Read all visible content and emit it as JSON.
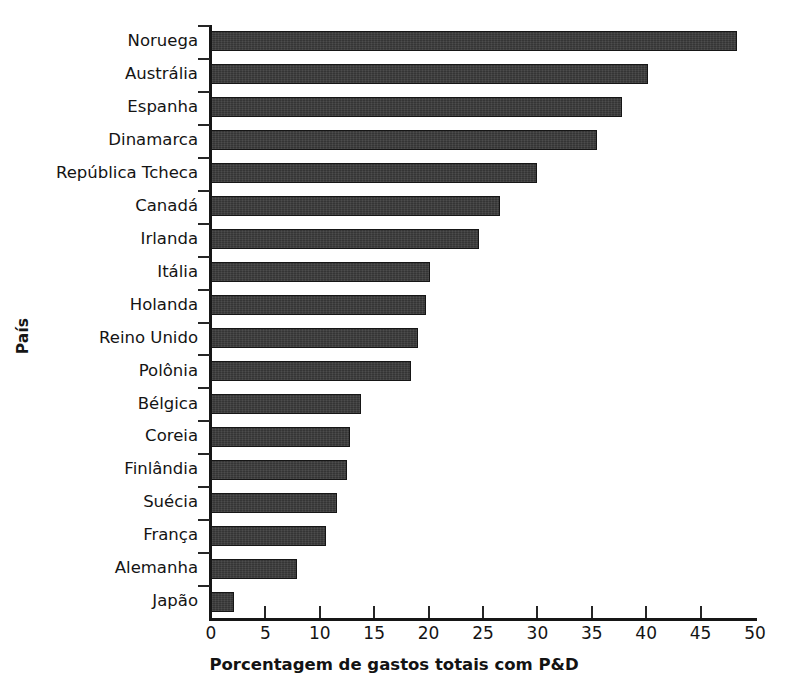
{
  "chart_data": {
    "type": "bar",
    "orientation": "horizontal",
    "title": "",
    "xlabel": "Porcentagem de gastos totais com P&D",
    "ylabel": "País",
    "xlim": [
      0,
      50
    ],
    "xticks": [
      0,
      5,
      10,
      15,
      20,
      25,
      30,
      35,
      40,
      45,
      50
    ],
    "xtick_labels": [
      "0",
      "5",
      "10",
      "15",
      "20",
      "25",
      "30",
      "35",
      "40",
      "45",
      "50"
    ],
    "grid": false,
    "legend": null,
    "bar_color": "#3b3b3b",
    "bar_edge_color": "#161616",
    "categories": [
      "Noruega",
      "Austrália",
      "Espanha",
      "Dinamarca",
      "República Tcheca",
      "Canadá",
      "Irlanda",
      "Itália",
      "Holanda",
      "Reino Unido",
      "Polônia",
      "Bélgica",
      "Coreia",
      "Finlândia",
      "Suécia",
      "França",
      "Alemanha",
      "Japão"
    ],
    "values": [
      48.3,
      40.2,
      37.8,
      35.5,
      30.0,
      26.6,
      24.6,
      20.1,
      19.8,
      19.0,
      18.4,
      13.8,
      12.8,
      12.5,
      11.6,
      10.6,
      7.9,
      2.1
    ]
  }
}
